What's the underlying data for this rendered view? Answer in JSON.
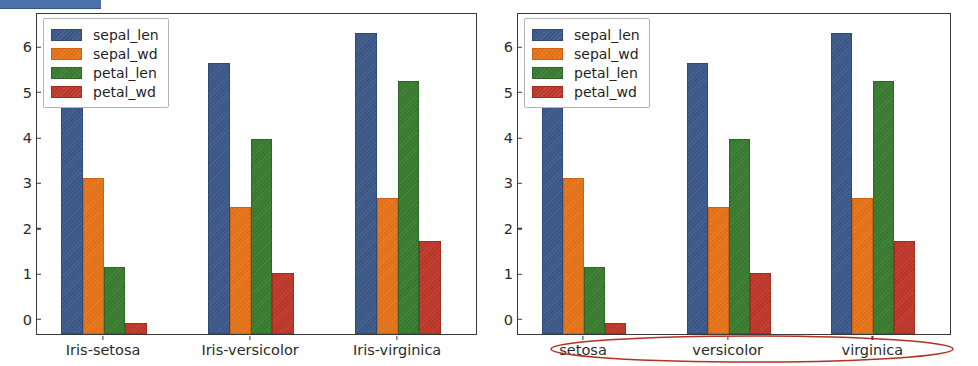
{
  "selection_strip": {
    "color": "#4a72a8",
    "label": "highlighted-text-selection"
  },
  "annotation": {
    "shape": "ellipse",
    "color": "#b33225",
    "target": "x-axis-tick-labels"
  },
  "palette": {
    "sepal_len": "#3d5a8a",
    "sepal_wd": "#e8751a",
    "petal_len": "#3a7d32",
    "petal_wd": "#c0392b"
  },
  "figures": [
    {
      "id": "left",
      "legend": {
        "position": "upper-left",
        "entries": [
          "sepal_len",
          "sepal_wd",
          "petal_len",
          "petal_wd"
        ]
      },
      "chart_data": {
        "type": "bar",
        "title": "",
        "xlabel": "",
        "ylabel": "",
        "grid": false,
        "ylim": [
          0,
          7.05
        ],
        "yticks": [
          "0",
          "1",
          "2",
          "3",
          "4",
          "5",
          "6"
        ],
        "ytick_values": [
          0,
          1,
          2,
          3,
          4,
          5,
          6
        ],
        "categories": [
          "Iris-setosa",
          "Iris-versicolor",
          "Iris-virginica"
        ],
        "series": [
          {
            "name": "sepal_len",
            "color": "#3d5a8a",
            "values": [
              5.01,
              5.94,
              6.59
            ]
          },
          {
            "name": "sepal_wd",
            "color": "#e8751a",
            "values": [
              3.42,
              2.77,
              2.97
            ]
          },
          {
            "name": "petal_len",
            "color": "#3a7d32",
            "values": [
              1.46,
              4.26,
              5.55
            ]
          },
          {
            "name": "petal_wd",
            "color": "#c0392b",
            "values": [
              0.24,
              1.33,
              2.03
            ]
          }
        ]
      }
    },
    {
      "id": "right",
      "legend": {
        "position": "upper-left",
        "entries": [
          "sepal_len",
          "sepal_wd",
          "petal_len",
          "petal_wd"
        ]
      },
      "chart_data": {
        "type": "bar",
        "title": "",
        "xlabel": "",
        "ylabel": "",
        "grid": false,
        "ylim": [
          0,
          7.05
        ],
        "yticks": [
          "0",
          "1",
          "2",
          "3",
          "4",
          "5",
          "6"
        ],
        "ytick_values": [
          0,
          1,
          2,
          3,
          4,
          5,
          6
        ],
        "categories": [
          "setosa",
          "versicolor",
          "virginica"
        ],
        "series": [
          {
            "name": "sepal_len",
            "color": "#3d5a8a",
            "values": [
              5.01,
              5.94,
              6.59
            ]
          },
          {
            "name": "sepal_wd",
            "color": "#e8751a",
            "values": [
              3.42,
              2.77,
              2.97
            ]
          },
          {
            "name": "petal_len",
            "color": "#3a7d32",
            "values": [
              1.46,
              4.26,
              5.55
            ]
          },
          {
            "name": "petal_wd",
            "color": "#c0392b",
            "values": [
              0.24,
              1.33,
              2.03
            ]
          }
        ]
      }
    }
  ]
}
